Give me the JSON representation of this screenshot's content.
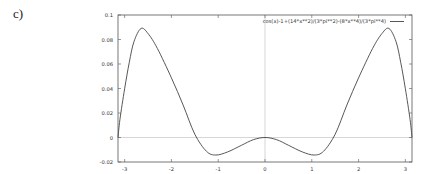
{
  "panel_label": "c)",
  "chart_data": {
    "type": "line",
    "title": "",
    "xlabel": "",
    "ylabel": "",
    "xlim": [
      -3.1416,
      3.1416
    ],
    "ylim": [
      -0.02,
      0.1
    ],
    "x_ticks": [
      -3,
      -2,
      -1,
      0,
      1,
      2,
      3
    ],
    "x_tick_labels": [
      "-3",
      "-2",
      "-1",
      "0",
      "1",
      "2",
      "3"
    ],
    "y_ticks": [
      -0.02,
      0,
      0.02,
      0.04,
      0.06,
      0.08,
      0.1
    ],
    "y_tick_labels": [
      "-0.02",
      "0",
      "0.02",
      "0.04",
      "0.06",
      "0.08",
      "0.1"
    ],
    "grid": false,
    "zero_axes": true,
    "legend_position": "top-right",
    "series": [
      {
        "name": "cos(x)-1+(14*x**2)/(3*pi**2)-(8*x**4)/(3*pi**4)",
        "color": "#444444",
        "x": [
          -3.1416,
          -3.1,
          -3.0,
          -2.9,
          -2.8,
          -2.65,
          -2.5,
          -2.3,
          -2.0,
          -1.75,
          -1.5,
          -1.25,
          -1.05,
          -0.8,
          -0.5,
          -0.25,
          0,
          0.25,
          0.5,
          0.8,
          1.05,
          1.25,
          1.5,
          1.75,
          2.0,
          2.3,
          2.5,
          2.65,
          2.8,
          2.9,
          3.0,
          3.1,
          3.1416
        ],
        "y": [
          0,
          0.0148,
          0.0398,
          0.0614,
          0.0783,
          0.089,
          0.0849,
          0.0727,
          0.0487,
          0.0265,
          0.0027,
          -0.0113,
          -0.0143,
          -0.0118,
          -0.0063,
          -0.0018,
          0,
          -0.0018,
          -0.0063,
          -0.0118,
          -0.0143,
          -0.0113,
          0.0027,
          0.0265,
          0.0487,
          0.0727,
          0.0849,
          0.089,
          0.0783,
          0.0614,
          0.0398,
          0.0148,
          0
        ]
      }
    ]
  }
}
